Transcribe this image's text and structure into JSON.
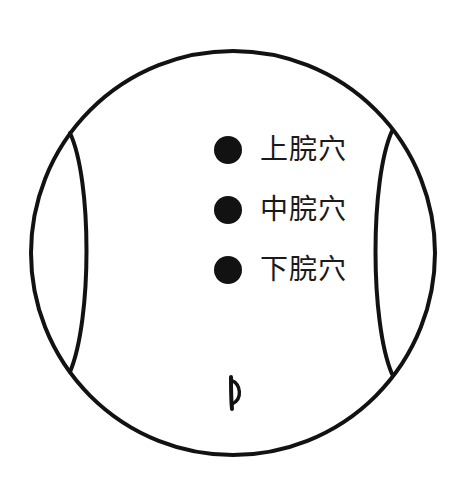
{
  "diagram": {
    "kind": "acupoint-abdomen-diagram",
    "background_color": "#ffffff",
    "stroke_color": "#121212",
    "outline": {
      "name": "torso-outline",
      "shape": "circle",
      "center_x": 233,
      "center_y": 253,
      "radius": 202,
      "stroke_width": 4
    },
    "flanks": [
      {
        "name": "left-flank-contour",
        "top_junction": [
          70,
          133
        ],
        "bottom_junction": [
          70,
          372
        ],
        "apex_x": 88,
        "stroke_width": 4
      },
      {
        "name": "right-flank-contour",
        "top_junction": [
          392,
          131
        ],
        "bottom_junction": [
          392,
          374
        ],
        "apex_x": 376,
        "stroke_width": 4
      }
    ],
    "navel": {
      "name": "navel-mark",
      "center_x": 233,
      "center_y": 392,
      "width": 12,
      "height": 32
    },
    "points": [
      {
        "id": "shangwan",
        "label": "上脘穴",
        "dot_center": [
          228,
          150
        ],
        "dot_radius": 14,
        "color": "#121212"
      },
      {
        "id": "zhongwan",
        "label": "中脘穴",
        "dot_center": [
          228,
          210
        ],
        "dot_radius": 14,
        "color": "#121212"
      },
      {
        "id": "xiawan",
        "label": "下脘穴",
        "dot_center": [
          228,
          270
        ],
        "dot_radius": 14,
        "color": "#121212"
      }
    ]
  }
}
